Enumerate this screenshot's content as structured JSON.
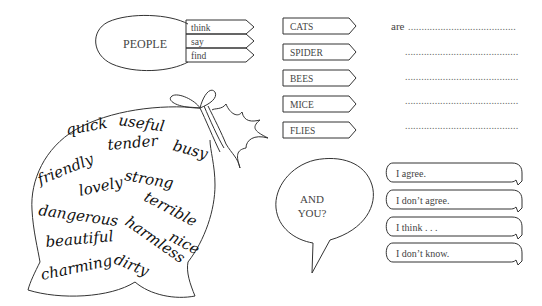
{
  "people": {
    "label": "PEOPLE",
    "verbs": [
      "think",
      "say",
      "find"
    ]
  },
  "subjects": [
    "CATS",
    "SPIDER",
    "BEES",
    "MICE",
    "FLIES"
  ],
  "completion": {
    "lead_word": "are",
    "line_count": 5
  },
  "adjective_bag": {
    "words": [
      "quick",
      "useful",
      "tender",
      "busy",
      "friendly",
      "strong",
      "lovely",
      "terrible",
      "dangerous",
      "harmless",
      "nice",
      "beautiful",
      "charming",
      "dirty"
    ]
  },
  "prompt_bubble": {
    "line1": "AND",
    "line2": "YOU?"
  },
  "responses": [
    "I agree.",
    "I don’t agree.",
    "I think . . .",
    "I don’t know."
  ]
}
